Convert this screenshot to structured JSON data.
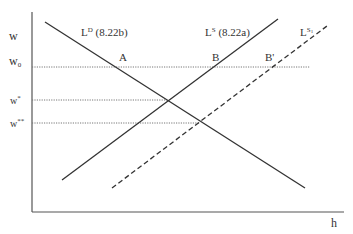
{
  "diagram": {
    "type": "labor market supply and demand diagram",
    "axes": {
      "y_label": "w",
      "x_label": "h"
    },
    "wage_levels": [
      {
        "id": "w0",
        "label_main": "w",
        "label_sub": "0"
      },
      {
        "id": "wstar",
        "label_main": "w",
        "label_sup": "*"
      },
      {
        "id": "wstarstar",
        "label_main": "w",
        "label_sup": "**"
      }
    ],
    "curves": [
      {
        "id": "LD",
        "label_main": "L",
        "label_sup": "D",
        "label_suffix": " (8.22b)",
        "style": "solid",
        "slope": "downward"
      },
      {
        "id": "LS",
        "label_main": "L",
        "label_sup": "S",
        "label_suffix": " (8.22a)",
        "style": "solid",
        "slope": "upward"
      },
      {
        "id": "LS1",
        "label_main": "L",
        "label_sup": "S",
        "label_sup_sub": "1",
        "style": "dashed",
        "slope": "upward"
      }
    ],
    "points": [
      {
        "id": "A",
        "label": "A"
      },
      {
        "id": "B",
        "label": "B"
      },
      {
        "id": "Bprime",
        "label": "B'"
      }
    ],
    "colors": {
      "line": "#333333",
      "axis": "#555555",
      "dotted": "#777777"
    }
  }
}
